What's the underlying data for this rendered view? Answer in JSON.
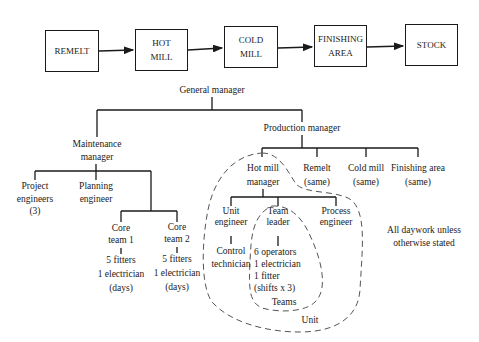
{
  "process_flow": {
    "boxes": [
      {
        "line1": "REMELT",
        "line2": ""
      },
      {
        "line1": "HOT",
        "line2": "MILL"
      },
      {
        "line1": "COLD",
        "line2": "MILL"
      },
      {
        "line1": "FINISHING",
        "line2": "AREA"
      },
      {
        "line1": "STOCK",
        "line2": ""
      }
    ]
  },
  "org_chart": {
    "general_manager": "General manager",
    "maintenance_manager": {
      "line1": "Maintenance",
      "line2": "manager"
    },
    "project_engineers": {
      "line1": "Project",
      "line2": "engineers",
      "line3": "(3)"
    },
    "planning_engineer": {
      "line1": "Planning",
      "line2": "engineer"
    },
    "core_team_1": {
      "line1": "Core",
      "line2": "team 1",
      "line3": "5 fitters",
      "line4": "1 electrician",
      "line5": "(days)"
    },
    "core_team_2": {
      "line1": "Core",
      "line2": "team 2",
      "line3": "5 fitters",
      "line4": "1 electrician",
      "line5": "(days)"
    },
    "production_manager": "Production manager",
    "hot_mill_manager": {
      "line1": "Hot mill",
      "line2": "manager"
    },
    "remelt": {
      "line1": "Remelt",
      "line2": "(same)"
    },
    "cold_mill": {
      "line1": "Cold mill",
      "line2": "(same)"
    },
    "finishing_area": {
      "line1": "Finishing area",
      "line2": "(same)"
    },
    "unit_engineer": {
      "line1": "Unit",
      "line2": "engineer"
    },
    "control_technician": {
      "line1": "Control",
      "line2": "technician"
    },
    "team_leader": {
      "line1": "Team",
      "line2": "leader"
    },
    "team_members": {
      "line1": "6 operators",
      "line2": "1 electrician",
      "line3": "1 fitter",
      "line4": "(shifts x 3)"
    },
    "process_engineer": {
      "line1": "Process",
      "line2": "engineer"
    },
    "teams_label": "Teams",
    "unit_label": "Unit"
  },
  "note": {
    "line1": "All daywork unless",
    "line2": "otherwise stated"
  }
}
